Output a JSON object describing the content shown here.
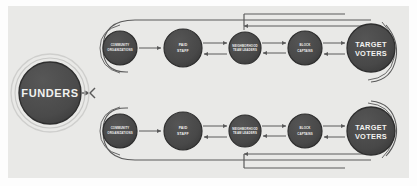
{
  "canvas": {
    "width": 417,
    "height": 186,
    "background": "#fdfdfd"
  },
  "panel": {
    "background": "#e9e9e7",
    "x": 8,
    "y": 6,
    "width": 401,
    "height": 172
  },
  "palette": {
    "node_fill": "#4a4a4a",
    "node_fill_dark": "#3f3f3f",
    "node_stroke": "#2e2e2e",
    "halo": "#d8d8d6",
    "connector": "#5a5a5a",
    "label_text": "#f2f2f0"
  },
  "diagram": {
    "type": "flow-network",
    "source_node": {
      "id": "funders",
      "label": "FUNDERS",
      "cx": 50,
      "cy": 93,
      "r": 31
    },
    "rows": [
      {
        "id": "row-top",
        "cy": 48,
        "nodes": [
          {
            "id": "community-organizations-top",
            "label_lines": [
              "COMMUNITY",
              "ORGANIZATIONS"
            ],
            "cx": 120,
            "r": 17
          },
          {
            "id": "paid-staff-top",
            "label_lines": [
              "PAID",
              "STAFF"
            ],
            "cx": 183,
            "r": 19
          },
          {
            "id": "neighborhood-team-leaders-top",
            "label_lines": [
              "NEIGHBORHOOD",
              "TEAM LEADERS"
            ],
            "cx": 245,
            "r": 16
          },
          {
            "id": "block-captains-top",
            "label_lines": [
              "BLOCK",
              "CAPTAINS"
            ],
            "cx": 305,
            "r": 17
          },
          {
            "id": "target-voters-top",
            "label_lines": [
              "TARGET",
              "VOTERS"
            ],
            "cx": 371,
            "r": 24
          }
        ]
      },
      {
        "id": "row-bottom",
        "cy": 131,
        "nodes": [
          {
            "id": "community-organizations-bottom",
            "label_lines": [
              "COMMUNITY",
              "ORGANIZATIONS"
            ],
            "cx": 120,
            "r": 17
          },
          {
            "id": "paid-staff-bottom",
            "label_lines": [
              "PAID",
              "STAFF"
            ],
            "cx": 183,
            "r": 19
          },
          {
            "id": "neighborhood-team-leaders-bottom",
            "label_lines": [
              "NEIGHBORHOOD",
              "TEAM LEADERS"
            ],
            "cx": 245,
            "r": 16
          },
          {
            "id": "block-captains-bottom",
            "label_lines": [
              "BLOCK",
              "CAPTAINS"
            ],
            "cx": 305,
            "r": 17
          },
          {
            "id": "target-voters-bottom",
            "label_lines": [
              "TARGET",
              "VOTERS"
            ],
            "cx": 371,
            "r": 24
          }
        ]
      }
    ],
    "connections": [
      {
        "from": "funders",
        "to": "row-top",
        "style": "branch-arrow"
      },
      {
        "from": "funders",
        "to": "row-bottom",
        "style": "branch-arrow"
      },
      {
        "from": "community-organizations",
        "to": "paid-staff",
        "style": "arrow"
      },
      {
        "from": "paid-staff",
        "to": "neighborhood-team-leaders",
        "style": "bidirectional"
      },
      {
        "from": "neighborhood-team-leaders",
        "to": "block-captains",
        "style": "bidirectional"
      },
      {
        "from": "block-captains",
        "to": "target-voters",
        "style": "bidirectional"
      },
      {
        "from": "target-voters",
        "to": "community-organizations",
        "style": "feedback-loop-outer"
      },
      {
        "from": "target-voters",
        "to": "neighborhood-team-leaders",
        "style": "feedback-loop-inner"
      }
    ]
  }
}
